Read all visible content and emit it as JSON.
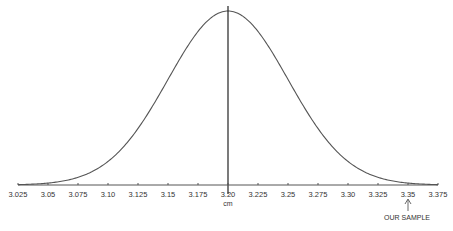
{
  "chart_data": {
    "type": "line",
    "title": "",
    "xlabel": "cm",
    "ylabel": "",
    "distribution": "normal",
    "mean": 3.2,
    "std_dev": 0.05,
    "xlim": [
      3.025,
      3.375
    ],
    "x_ticks": [
      "3.025",
      "3.05",
      "3.075",
      "3.10",
      "3.125",
      "3.15",
      "3.175",
      "3.20",
      "3.225",
      "3.25",
      "3.275",
      "3.30",
      "3.325",
      "3.35",
      "3.375"
    ],
    "mean_line": 3.2,
    "grid": false,
    "legend": null,
    "annotations": [
      {
        "text": "OUR SAMPLE",
        "x": 3.35,
        "type": "arrow-up"
      }
    ]
  },
  "colors": {
    "curve": "#444444",
    "axis": "#555555",
    "text": "#333333"
  }
}
